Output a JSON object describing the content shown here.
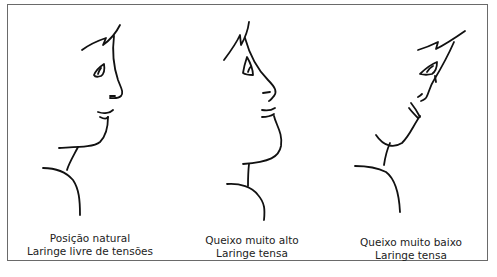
{
  "figure": {
    "panels": [
      {
        "id": "natural",
        "line1": "Posição natural",
        "line2": "Laringe livre de tensões"
      },
      {
        "id": "chin-high",
        "line1": "Queixo muito alto",
        "line2": "Laringe tensa"
      },
      {
        "id": "chin-low",
        "line1": "Queixo muito baixo",
        "line2": "Laringe tensa"
      }
    ],
    "colors": {
      "line": "#111111",
      "frame": "#6a6a6a",
      "background": "#ffffff"
    }
  }
}
